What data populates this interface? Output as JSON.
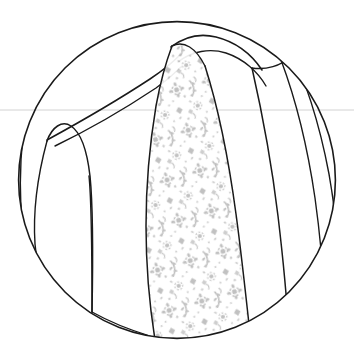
{
  "illustration": {
    "title": "Garment Shoulder Panel Detail",
    "type": "technical-line-drawing",
    "alt_text": "Circular cropped line drawing of a garment shoulder and bodice with a diagonal patterned panel",
    "canvas": {
      "width": 354,
      "height": 362,
      "background": "#ffffff"
    },
    "frame": {
      "name": "circular-crop",
      "shape": "circle",
      "center_x": 177,
      "center_y": 180,
      "radius": 159,
      "stroke": "#1a1a1a",
      "stroke_width": 1.6
    },
    "guideline": {
      "name": "horizontal-reference-line",
      "orientation": "horizontal",
      "y": 110,
      "x_start": 0,
      "x_end": 354,
      "color": "#d2d2d2",
      "stroke_width": 1
    },
    "colors": {
      "ink": "#1a1a1a",
      "pattern": "#b8b8b8",
      "pattern_light": "#d8d8d8",
      "guide": "#d2d2d2",
      "paper": "#ffffff"
    },
    "stroke_widths": {
      "outline": 1.6,
      "seam": 1.5,
      "detail": 1.2,
      "hairline": 1.0
    },
    "patterned_panel": {
      "name": "damask-floral-panel",
      "motif": "floral-damask",
      "fill_color": "#b8b8b8",
      "opacity": 0.55,
      "description": "Diagonal front placket band filled with small scattered floral and leaf damask motifs"
    },
    "regions": [
      {
        "name": "left-sleeve-cap",
        "label": "Left sleeve cap"
      },
      {
        "name": "left-bodice-panel",
        "label": "Left bodice panel"
      },
      {
        "name": "shoulder-yoke",
        "label": "Shoulder yoke"
      },
      {
        "name": "patterned-placket",
        "label": "Patterned placket band"
      },
      {
        "name": "center-right-panel",
        "label": "Center right panel"
      },
      {
        "name": "right-side-panel",
        "label": "Right side panel"
      },
      {
        "name": "right-sleeve-panel",
        "label": "Right sleeve panel"
      }
    ]
  }
}
